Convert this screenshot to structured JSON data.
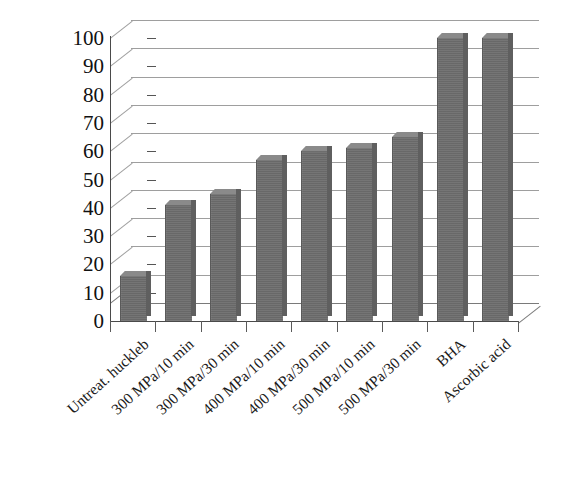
{
  "chart_data": {
    "type": "bar",
    "title": "",
    "subtitle": "",
    "xlabel": "",
    "ylabel": "",
    "ylim": [
      0,
      100
    ],
    "ytick_step": 10,
    "yticks": [
      "100",
      "90",
      "80",
      "70",
      "60",
      "50",
      "40",
      "30",
      "20",
      "10",
      "0"
    ],
    "grid": true,
    "legend": "none",
    "style": "3d-bar",
    "bar_color": "#6e6e6e",
    "grid_color": "#8d8d8d",
    "axis_color": "#4a4a4a",
    "categories": [
      "Untreat. huckleb",
      "300 MPa/10 min",
      "300 MPa/30 min",
      "400 MPa/10 min",
      "400 MPa/30 min",
      "500 MPa/10 min",
      "500 MPa/30 min",
      "BHA",
      "Ascorbic acid"
    ],
    "values": [
      16,
      41,
      45,
      57,
      60,
      61,
      65,
      100,
      100
    ]
  }
}
